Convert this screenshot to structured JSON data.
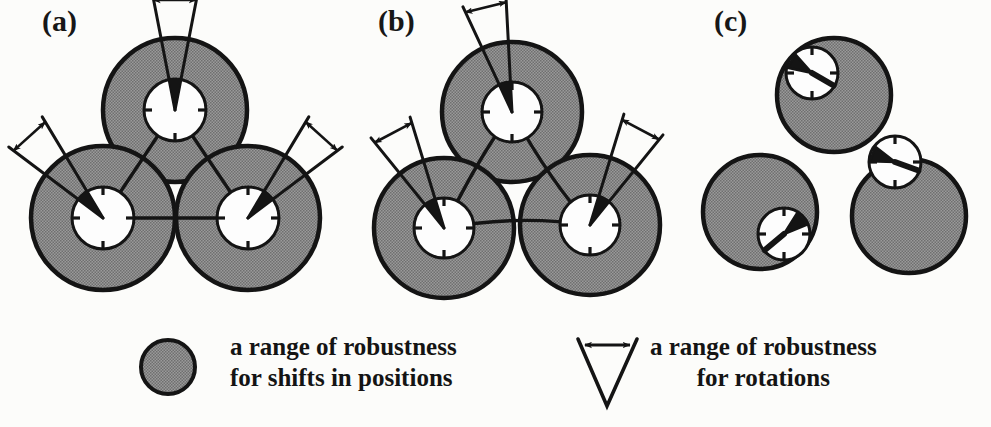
{
  "figure": {
    "background_color": "#fcfcfa",
    "ink_color": "#141414",
    "fill_gray": "#8a8a8a",
    "dial_white": "#fdfdfd"
  },
  "panels": [
    {
      "id": "a",
      "label": "(a)",
      "description": "three overlapping gray range circles with centered dials, aligned wedges and connecting lines",
      "nodes": [
        {
          "name": "top",
          "cx": 175,
          "cy": 110,
          "r_outer": 72,
          "r_inner": 31,
          "dial_offset_x": 0,
          "dial_offset_y": 0,
          "wedge_dir_deg": -90,
          "wedge_half_deg": 11
        },
        {
          "name": "bottom-left",
          "cx": 103,
          "cy": 218,
          "r_outer": 72,
          "r_inner": 31,
          "dial_offset_x": 0,
          "dial_offset_y": 0,
          "wedge_dir_deg": -132,
          "wedge_half_deg": 11
        },
        {
          "name": "bottom-right",
          "cx": 248,
          "cy": 218,
          "r_outer": 72,
          "r_inner": 31,
          "dial_offset_x": 0,
          "dial_offset_y": 0,
          "wedge_dir_deg": -48,
          "wedge_half_deg": 11
        }
      ]
    },
    {
      "id": "b",
      "label": "(b)",
      "description": "same three range circles with rotated wedges and slightly perturbed connecting lines",
      "nodes": [
        {
          "name": "top",
          "cx": 512,
          "cy": 112,
          "r_outer": 70,
          "r_inner": 30,
          "dial_offset_x": 0,
          "dial_offset_y": 0,
          "wedge_dir_deg": -104,
          "wedge_half_deg": 11
        },
        {
          "name": "bottom-left",
          "cx": 444,
          "cy": 228,
          "r_outer": 70,
          "r_inner": 30,
          "dial_offset_x": 0,
          "dial_offset_y": 0,
          "wedge_dir_deg": -118,
          "wedge_half_deg": 11
        },
        {
          "name": "bottom-right",
          "cx": 590,
          "cy": 225,
          "r_outer": 70,
          "r_inner": 30,
          "dial_offset_x": 0,
          "dial_offset_y": 0,
          "wedge_dir_deg": -62,
          "wedge_half_deg": 11
        }
      ]
    },
    {
      "id": "c",
      "label": "(c)",
      "description": "three separated gray range circles with off-centre dials and no connecting lines or rotation arrows",
      "nodes": [
        {
          "name": "top",
          "cx": 834,
          "cy": 95,
          "r_outer": 57,
          "r_inner": 26,
          "dial_offset_x": -22,
          "dial_offset_y": -22,
          "wedge_dir_deg": -150,
          "wedge_half_deg": 18
        },
        {
          "name": "bottom-left",
          "cx": 760,
          "cy": 212,
          "r_outer": 57,
          "r_inner": 26,
          "dial_offset_x": 24,
          "dial_offset_y": 22,
          "wedge_dir_deg": -40,
          "wedge_half_deg": 18
        },
        {
          "name": "bottom-right",
          "cx": 909,
          "cy": 216,
          "r_outer": 57,
          "r_inner": 26,
          "dial_offset_x": -14,
          "dial_offset_y": -54,
          "wedge_dir_deg": -160,
          "wedge_half_deg": 18
        }
      ]
    }
  ],
  "legend": {
    "items": [
      {
        "icon": "gray-circle-swatch",
        "lines": [
          "a range of robustness",
          "for shifts in positions"
        ],
        "align": "left"
      },
      {
        "icon": "arrow-wedge-swatch",
        "lines": [
          "a range of robustness",
          "for rotations"
        ],
        "align": "center"
      }
    ]
  }
}
